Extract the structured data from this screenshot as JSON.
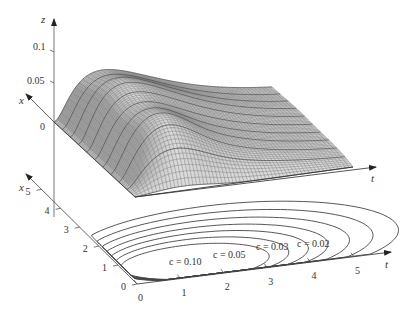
{
  "figure": {
    "upper_panel": {
      "z_axis_label": "z",
      "x_axis_label": "x",
      "t_axis_label": "t",
      "z_ticks": [
        "0.1",
        "0.05",
        "0"
      ]
    },
    "lower_panel": {
      "x_axis_label": "x",
      "t_axis_label": "t",
      "x_ticks": [
        "0",
        "1",
        "2",
        "3",
        "4",
        "5"
      ],
      "t_ticks": [
        "0",
        "1",
        "2",
        "3",
        "4",
        "5"
      ],
      "contour_labels": [
        "c = 0.10",
        "c = 0.05",
        "c = 0.03",
        "c = 0.02"
      ]
    }
  },
  "chart_data": [
    {
      "type": "surface",
      "title": "",
      "xlabel": "t",
      "ylabel": "x",
      "zlabel": "z",
      "z_ticks": [
        0,
        0.05,
        0.1
      ],
      "x_range": [
        0,
        5
      ],
      "t_range": [
        0,
        5
      ],
      "zlim": [
        0,
        0.13
      ],
      "description": "Wireframe surface z(t,x) that is zero along t=0 and x=0, rises to a single peak of about 0.08 near t≈1, x≈1, then decays with increasing t; flattens into a plateau toward large x.",
      "peak": {
        "t": 1.0,
        "x": 1.0,
        "z": 0.08
      }
    },
    {
      "type": "contour",
      "xlabel": "t",
      "ylabel": "x",
      "x_ticks": [
        0,
        1,
        2,
        3,
        4,
        5
      ],
      "y_ticks": [
        0,
        1,
        2,
        3,
        4,
        5
      ],
      "levels": [
        0.1,
        0.05,
        0.03,
        0.02
      ],
      "level_labels": [
        "c = 0.10",
        "c = 0.05",
        "c = 0.03",
        "c = 0.02"
      ],
      "description": "Nested closed level curves of the surface projected onto the t-x plane, with innermost level c=0.10 near t≈1 and outer levels extending toward larger t."
    }
  ]
}
